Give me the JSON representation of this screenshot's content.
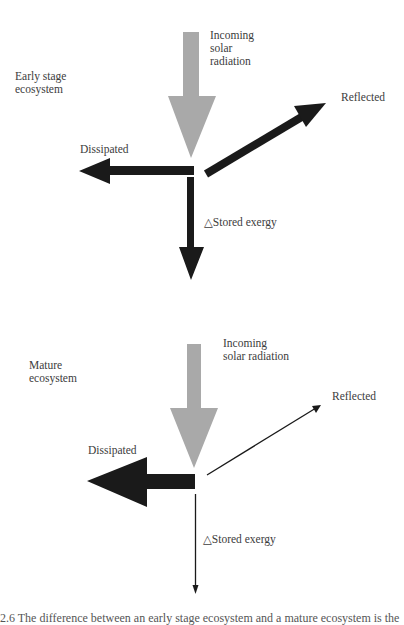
{
  "colors": {
    "incoming": "#a9a9a9",
    "flow": "#1a1a1a",
    "text": "#3c3c3c"
  },
  "early": {
    "stage_label": "Early stage\necosystem",
    "incoming_label": "Incoming\nsolar\nradiation",
    "reflected_label": "Reflected",
    "dissipated_label": "Dissipated",
    "stored_label": "△Stored exergy"
  },
  "mature": {
    "stage_label": "Mature\necosystem",
    "incoming_label": "Incoming\nsolar radiation",
    "reflected_label": "Reflected",
    "dissipated_label": "Dissipated",
    "stored_label": "△Stored exergy"
  },
  "caption": "2.6  The difference between an early stage ecosystem and a mature ecosystem is the"
}
